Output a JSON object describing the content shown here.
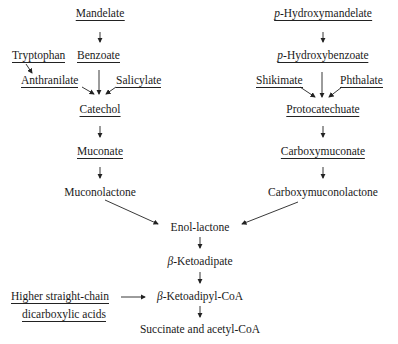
{
  "diagram": {
    "left_branch": {
      "mandelate": "Mandelate",
      "tryptophan": "Tryptophan",
      "benzoate": "Benzoate",
      "anthranilate": "Anthranilate",
      "salicylate": "Salicylate",
      "catechol": "Catechol",
      "muconate": "Muconate",
      "muconolactone": "Muconolactone"
    },
    "right_branch": {
      "p_hydroxymandelate_prefix": "p",
      "p_hydroxymandelate": "-Hydroxymandelate",
      "p_hydroxybenzoate_prefix": "p",
      "p_hydroxybenzoate": "-Hydroxybenzoate",
      "shikimate": "Shikimate",
      "phthalate": "Phthalate",
      "protocatechuate": "Protocatechuate",
      "carboxymuconate": "Carboxymuconate",
      "carboxymuconolactone": "Carboxymuconolactone"
    },
    "convergent": {
      "enol_lactone": "Enol-lactone",
      "beta_prefix_1": "β",
      "beta_ketoadipate": "-Ketoadipate",
      "beta_prefix_2": "β",
      "beta_ketoadipyl_coa": "-Ketoadipyl-CoA",
      "higher_acids_line1": "Higher straight-chain",
      "higher_acids_line2": "dicarboxylic acids",
      "products": "Succinate and acetyl-CoA"
    },
    "colors": {
      "text": "#1a1a1a",
      "lines": "#222222",
      "background": "#ffffff"
    }
  }
}
